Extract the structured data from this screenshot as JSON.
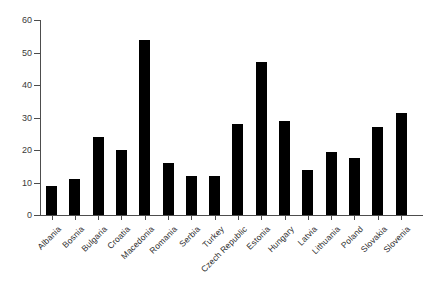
{
  "chart_data": {
    "type": "bar",
    "title": "",
    "subtitle": "",
    "xlabel": "",
    "ylabel": "",
    "ylim": [
      0,
      60
    ],
    "yticks": [
      0,
      10,
      20,
      30,
      40,
      50,
      60
    ],
    "grid": false,
    "legend": null,
    "bar_color": "#000000",
    "axis_color": "#4d4d4d",
    "categories": [
      "Albania",
      "Bosnia",
      "Bulgaria",
      "Croatia",
      "Macedonia",
      "Romania",
      "Serbia",
      "Turkey",
      "Czech Republic",
      "Estonia",
      "Hungary",
      "Latvia",
      "Lithuania",
      "Poland",
      "Slovakia",
      "Slovenia"
    ],
    "values": [
      9,
      11,
      24,
      20,
      54,
      16,
      12,
      12,
      28,
      47,
      29,
      14,
      19.5,
      17.5,
      27,
      31.5
    ]
  }
}
